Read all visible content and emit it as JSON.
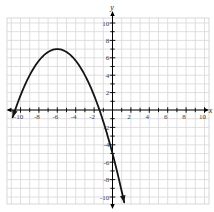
{
  "figure": {
    "background": "#ffffff",
    "grid_color": "#d7d7db",
    "axis_color": "#000000",
    "tick_label_color": "#3a3a3a"
  },
  "chart_data": {
    "type": "line",
    "title": "",
    "xlabel": "x",
    "ylabel": "y",
    "grid": true,
    "xlim": [
      -11.5,
      10.5
    ],
    "ylim": [
      -10.8,
      10.6
    ],
    "tick_step": 1,
    "label_step": 2,
    "x_tick_labels": [
      "-10",
      "-8",
      "-6",
      "-4",
      "-2",
      "2",
      "4",
      "6",
      "8",
      "10"
    ],
    "y_tick_labels": [
      "-10",
      "-8",
      "-6",
      "-4",
      "-2",
      "2",
      "4",
      "6",
      "8",
      "10"
    ],
    "axis_arrows": true,
    "series": [
      {
        "name": "downward-parabola",
        "equation": "y = -(1/3)(x + 6)^2 + 7",
        "a": -0.33333333,
        "vertex": {
          "x": -6,
          "y": 7
        },
        "x_intercepts": [
          -10.58,
          -1.42
        ],
        "y_intercept": -5,
        "drawn_domain": [
          -10.85,
          1.27
        ],
        "end_arrows": "both",
        "color": "#141414",
        "width": 1.8
      }
    ]
  }
}
